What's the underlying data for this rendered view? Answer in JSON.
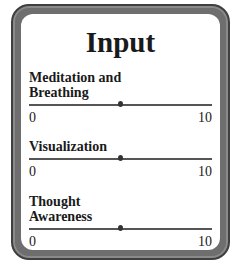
{
  "panel": {
    "title": "Input"
  },
  "sliders": [
    {
      "label_lines": [
        "Meditation and",
        "Breathing"
      ],
      "min": "0",
      "max": "10",
      "value": 5
    },
    {
      "label_lines": [
        "Visualization"
      ],
      "min": "0",
      "max": "10",
      "value": 5
    },
    {
      "label_lines": [
        "Thought",
        "Awareness"
      ],
      "min": "0",
      "max": "10",
      "value": 5
    }
  ]
}
